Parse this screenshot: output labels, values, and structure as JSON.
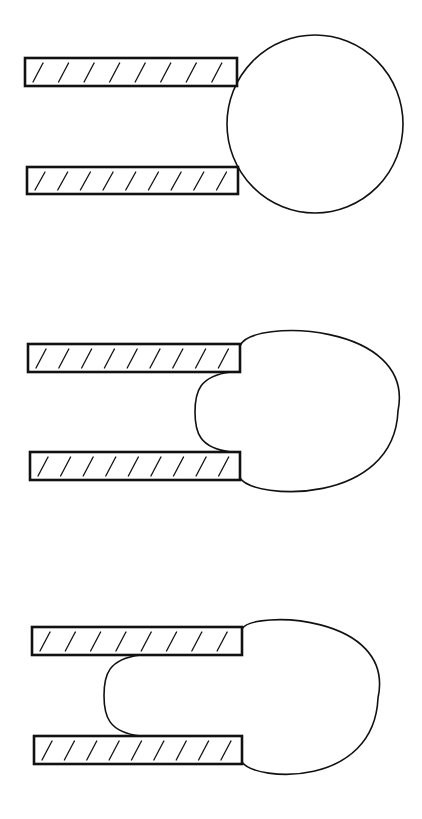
{
  "diagram": {
    "stroke_color": "#111111",
    "background_color": "#ffffff",
    "panels": [
      {
        "id": "stage-1",
        "plates": [
          {
            "x": 25,
            "y": 58,
            "w": 212,
            "h": 28,
            "hatch_count": 8
          },
          {
            "x": 27,
            "y": 167,
            "w": 211,
            "h": 27,
            "hatch_count": 9
          }
        ],
        "bubble": {
          "type": "circle",
          "cx": 315,
          "cy": 124,
          "rx": 88,
          "ry": 89,
          "inner_bulge_x": null
        }
      },
      {
        "id": "stage-2",
        "plates": [
          {
            "x": 28,
            "y": 344,
            "w": 212,
            "h": 28,
            "hatch_count": 9
          },
          {
            "x": 30,
            "y": 452,
            "w": 210,
            "h": 28,
            "hatch_count": 9
          }
        ],
        "bubble": {
          "type": "circle-with-bulge",
          "cx": 320,
          "cy": 411,
          "rx": 78,
          "ry": 89,
          "inner_bulge_x": 195
        }
      },
      {
        "id": "stage-3",
        "plates": [
          {
            "x": 32,
            "y": 627,
            "w": 210,
            "h": 28,
            "hatch_count": 8
          },
          {
            "x": 34,
            "y": 736,
            "w": 208,
            "h": 28,
            "hatch_count": 9
          }
        ],
        "bubble": {
          "type": "circle-with-bulge",
          "cx": 312,
          "cy": 698,
          "rx": 66,
          "ry": 84,
          "inner_bulge_x": 104
        }
      }
    ]
  }
}
